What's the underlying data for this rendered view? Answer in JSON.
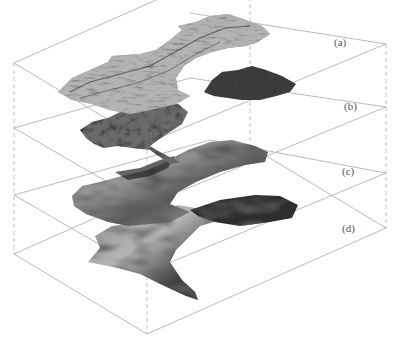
{
  "figure": {
    "layers": [
      {
        "id": "a",
        "label": "(a)",
        "texture": "rough-grey-satellite"
      },
      {
        "id": "b",
        "label": "(b)",
        "texture": "dark-mottled"
      },
      {
        "id": "c",
        "label": "(c)",
        "texture": "smooth-shaded"
      },
      {
        "id": "d",
        "label": "(d)",
        "texture": "smooth-shaded"
      }
    ]
  },
  "colors": {
    "background": "#ffffff",
    "box_edge": "#a8a8a8",
    "label": "#555555"
  }
}
